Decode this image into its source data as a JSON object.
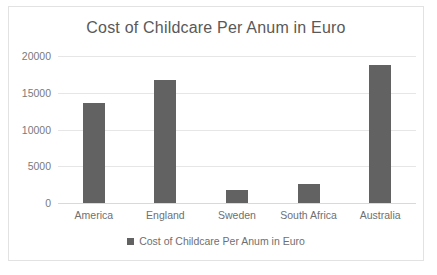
{
  "chart_data": {
    "type": "bar",
    "title": "Cost of Childcare Per Anum in Euro",
    "xlabel": "",
    "ylabel": "",
    "categories": [
      "America",
      "England",
      "Sweden",
      "South Africa",
      "Australia"
    ],
    "values": [
      13571,
      16714,
      1714,
      2571,
      18714
    ],
    "series": [
      {
        "name": "Cost of Childcare Per Anum in Euro",
        "values": [
          13571,
          16714,
          1714,
          2571,
          18714
        ],
        "color": "#626262"
      }
    ],
    "ylim": [
      0,
      20000
    ],
    "yticks": [
      0,
      5000,
      10000,
      15000,
      20000
    ],
    "ytick_labels": [
      "0",
      "5000",
      "10000",
      "15000",
      "20000"
    ],
    "grid": true,
    "legend": {
      "position": "bottom",
      "entries": [
        {
          "label": "Cost of Childcare Per Anum in Euro",
          "marker": "square-swatch",
          "color": "#626262"
        }
      ]
    },
    "colors": {
      "bar": "#626262",
      "gridline": "#e6e6e6",
      "baseline": "#d9d9d9",
      "title_text": "#595959",
      "tick_text": "#7a7a7a",
      "border": "#e2e2e2",
      "background": "#ffffff"
    }
  }
}
